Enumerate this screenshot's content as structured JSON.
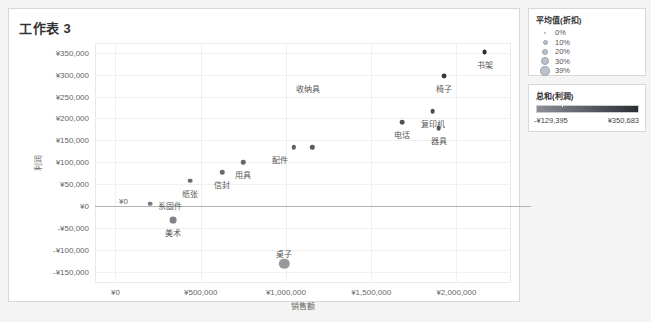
{
  "worksheet": {
    "title": "工作表 3"
  },
  "chart_data": {
    "type": "scatter",
    "title": "工作表 3",
    "xlabel": "销售额",
    "ylabel": "利润",
    "xlim": [
      -120000,
      2320000
    ],
    "ylim": [
      -175000,
      372000
    ],
    "xticks": [
      "¥0",
      "¥500,000",
      "¥1,000,000",
      "¥1,500,000",
      "¥2,000,000"
    ],
    "xtick_values": [
      0,
      500000,
      1000000,
      1500000,
      2000000
    ],
    "yticks": [
      "¥350,000",
      "¥300,000",
      "¥250,000",
      "¥200,000",
      "¥150,000",
      "¥100,000",
      "¥50,000",
      "¥0",
      "-¥50,000",
      "-¥100,000",
      "-¥150,000"
    ],
    "ytick_values": [
      350000,
      300000,
      250000,
      200000,
      150000,
      100000,
      50000,
      0,
      -50000,
      -100000,
      -150000
    ],
    "grid": true,
    "zero_reference_line": 0,
    "zero_x_label": "¥0",
    "legend_position": "right",
    "points": [
      {
        "label": "书架",
        "x": 2165000,
        "y": 352000,
        "discount": 0.1,
        "profit": 352000,
        "label_dx": 0,
        "label_dy": 7
      },
      {
        "label": "椅子",
        "x": 1925000,
        "y": 296000,
        "discount": 0.1,
        "profit": 296000,
        "label_dx": 0,
        "label_dy": 7
      },
      {
        "label": "复印机",
        "x": 1860000,
        "y": 216000,
        "discount": 0.09,
        "profit": 216000,
        "label_dx": 0,
        "label_dy": 7
      },
      {
        "label": "电话",
        "x": 1680000,
        "y": 192000,
        "discount": 0.09,
        "profit": 192000,
        "label_dx": 0,
        "label_dy": 7
      },
      {
        "label": "器具",
        "x": 1895000,
        "y": 178000,
        "discount": 0.09,
        "profit": 178000,
        "label_dx": 0,
        "label_dy": 7
      },
      {
        "label": "收纳具",
        "x": 1130000,
        "y": 286000,
        "discount": 0.1,
        "profit": 286000,
        "label_dx": 0,
        "label_dy": 2,
        "marker_hidden": true
      },
      {
        "label": "配件",
        "x": 1045000,
        "y": 134000,
        "discount": 0.07,
        "profit": 134000,
        "label_dx": -14,
        "label_dy": 7
      },
      {
        "label": "",
        "x": 1155000,
        "y": 134000,
        "discount": 0.07,
        "profit": 134000,
        "label_dx": 0,
        "label_dy": 0
      },
      {
        "label": "用具",
        "x": 748000,
        "y": 100000,
        "discount": 0.08,
        "profit": 100000,
        "label_dx": 0,
        "label_dy": 7
      },
      {
        "label": "信封",
        "x": 625000,
        "y": 78000,
        "discount": 0.08,
        "profit": 78000,
        "label_dx": 0,
        "label_dy": 7
      },
      {
        "label": "纸张",
        "x": 440000,
        "y": 58000,
        "discount": 0.09,
        "profit": 58000,
        "label_dx": 0,
        "label_dy": 7
      },
      {
        "label": "系固件",
        "x": 205000,
        "y": 6000,
        "discount": 0.09,
        "profit": 6000,
        "label_dx": 20,
        "label_dy": -4
      },
      {
        "label": "美术",
        "x": 340000,
        "y": -32000,
        "discount": 0.2,
        "profit": -32000,
        "label_dx": 0,
        "label_dy": 7
      },
      {
        "label": "桌子",
        "x": 990000,
        "y": -131000,
        "discount": 0.39,
        "profit": -131000,
        "label_dx": 0,
        "label_dy": -16
      }
    ]
  },
  "legend_size": {
    "title": "平均值(折扣)",
    "items": [
      {
        "label": "0%",
        "size": 2
      },
      {
        "label": "10%",
        "size": 5
      },
      {
        "label": "20%",
        "size": 6.5
      },
      {
        "label": "30%",
        "size": 8
      },
      {
        "label": "39%",
        "size": 9.5
      }
    ]
  },
  "legend_color": {
    "title": "总和(利润)",
    "min": "-¥129,395",
    "max": "¥350,683",
    "ramp_low": "#8c8f95",
    "ramp_high": "#2a2e35"
  }
}
